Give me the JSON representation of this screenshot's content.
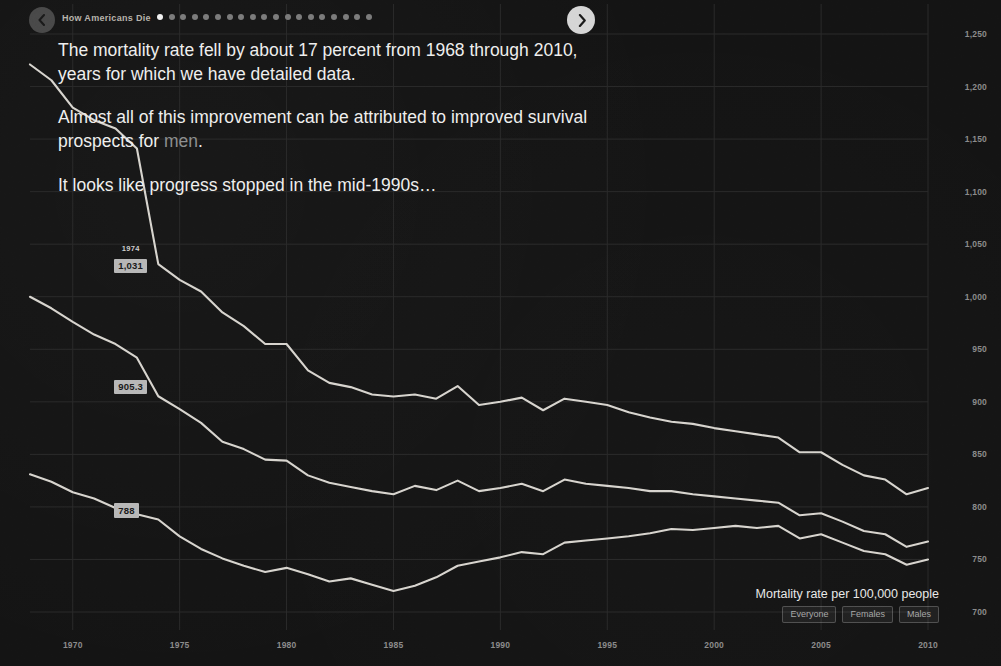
{
  "header": {
    "title": "How Americans Die",
    "prev_icon": "chevron-left-icon",
    "next_icon": "chevron-right-icon",
    "total_slides": 19,
    "active_slide": 1
  },
  "narrative": {
    "p1": "The mortality rate fell by about 17 percent from 1968 through 2010, years for which we have detailed data.",
    "p2_before": "Almost all of this improvement can be attributed to improved survival prospects for ",
    "p2_highlight": "men",
    "p2_after": ".",
    "p3": "It looks like progress stopped in the mid-1990s…"
  },
  "footer": {
    "caption": "Mortality rate per 100,000 people",
    "legend": [
      {
        "label": "Everyone"
      },
      {
        "label": "Females"
      },
      {
        "label": "Males"
      }
    ]
  },
  "annotations": [
    {
      "year": "1974",
      "value": "1,031",
      "series": "Males"
    },
    {
      "year": "",
      "value": "905.3",
      "series": "Everyone"
    },
    {
      "year": "",
      "value": "788",
      "series": "Females"
    }
  ],
  "colors": {
    "background": "#141414",
    "line": "#d8d5cf",
    "grid": "#2b2b2b",
    "axis_text": "#8d8d8d",
    "body_text": "#efefee",
    "highlight_text": "#8e9091",
    "annotation_bg": "#b8b8b8"
  },
  "chart_data": {
    "type": "line",
    "title": "Mortality rate per 100,000 people",
    "xlabel": "",
    "ylabel": "Mortality rate per 100,000 people",
    "xlim": [
      1968,
      2010
    ],
    "ylim": [
      700,
      1250
    ],
    "grid": true,
    "legend_position": "bottom-right",
    "xticks": [
      "1970",
      "1975",
      "1980",
      "1985",
      "1990",
      "1995",
      "2000",
      "2005",
      "2010"
    ],
    "yticks": [
      "1,250",
      "1,200",
      "1,150",
      "1,100",
      "1,050",
      "1,000",
      "950",
      "900",
      "850",
      "800",
      "750",
      "700"
    ],
    "x": [
      1968,
      1969,
      1970,
      1971,
      1972,
      1973,
      1974,
      1975,
      1976,
      1977,
      1978,
      1979,
      1980,
      1981,
      1982,
      1983,
      1984,
      1985,
      1986,
      1987,
      1988,
      1989,
      1990,
      1991,
      1992,
      1993,
      1994,
      1995,
      1996,
      1997,
      1998,
      1999,
      2000,
      2001,
      2002,
      2003,
      2004,
      2005,
      2006,
      2007,
      2008,
      2009,
      2010
    ],
    "series": [
      {
        "name": "Males",
        "values": [
          1221,
          1206,
          1180,
          1168,
          1160,
          1141,
          1031,
          1016,
          1005,
          985,
          972,
          955,
          955,
          930,
          918,
          914,
          907,
          905,
          907,
          903,
          915,
          897,
          900,
          904,
          892,
          903,
          900,
          897,
          890,
          885,
          881,
          879,
          875,
          872,
          869,
          866,
          852,
          852,
          840,
          830,
          826,
          812,
          818
        ]
      },
      {
        "name": "Everyone",
        "values": [
          1000,
          989,
          976,
          964,
          955,
          942,
          905.3,
          893,
          880,
          862,
          855,
          845,
          844,
          830,
          823,
          819,
          815,
          812,
          820,
          816,
          825,
          815,
          818,
          822,
          815,
          826,
          822,
          820,
          818,
          815,
          815,
          812,
          810,
          808,
          806,
          804,
          792,
          794,
          786,
          777,
          774,
          762,
          767
        ]
      },
      {
        "name": "Females",
        "values": [
          831,
          824,
          814,
          808,
          799,
          793,
          788,
          772,
          760,
          751,
          744,
          738,
          742,
          736,
          729,
          732,
          726,
          720,
          725,
          733,
          744,
          748,
          752,
          757,
          755,
          766,
          768,
          770,
          772,
          775,
          779,
          778,
          780,
          782,
          780,
          782,
          770,
          774,
          766,
          758,
          755,
          745,
          750
        ]
      }
    ]
  }
}
